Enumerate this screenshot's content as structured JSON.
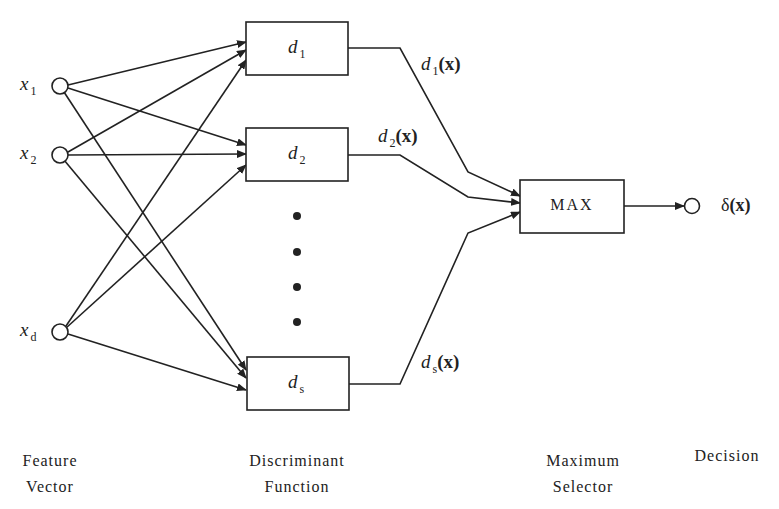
{
  "inputs": [
    {
      "var": "x",
      "sub": "1"
    },
    {
      "var": "x",
      "sub": "2"
    },
    {
      "var": "x",
      "sub": "d"
    }
  ],
  "discriminants": [
    {
      "var": "d",
      "sub": "1",
      "output_var": "d",
      "output_sub": "1",
      "output_arg": "(x)"
    },
    {
      "var": "d",
      "sub": "2",
      "output_var": "d",
      "output_sub": "2",
      "output_arg": "(x)"
    },
    {
      "var": "d",
      "sub": "s",
      "output_var": "d",
      "output_sub": "s",
      "output_arg": "(x)"
    }
  ],
  "selector": {
    "label": "MAX"
  },
  "output": {
    "symbol": "δ",
    "arg": "(x)"
  },
  "captions": {
    "feature_line1": "Feature",
    "feature_line2": "Vector",
    "discriminant_line1": "Discriminant",
    "discriminant_line2": "Function",
    "selector_line1": "Maximum",
    "selector_line2": "Selector",
    "decision": "Decision"
  },
  "colors": {
    "stroke": "#222222",
    "background": "#ffffff"
  }
}
